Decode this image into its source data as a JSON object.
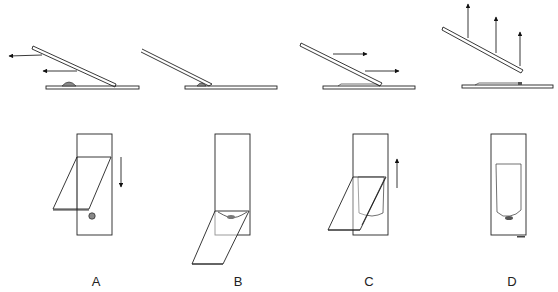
{
  "figure": {
    "panels": [
      {
        "id": "A",
        "label": "A",
        "stage": "spreader slide drawn back into drop",
        "side_arrows": "left",
        "top_arrow": "down"
      },
      {
        "id": "B",
        "label": "B",
        "stage": "drop spreads along edge of spreader",
        "side_arrows": "none",
        "top_arrow": "none"
      },
      {
        "id": "C",
        "label": "C",
        "stage": "spreader pushed forward forming film",
        "side_arrows": "right",
        "top_arrow": "up"
      },
      {
        "id": "D",
        "label": "D",
        "stage": "spreader lifted, finished smear",
        "side_arrows": "up",
        "top_arrow": "none"
      }
    ]
  },
  "labels": {
    "a": "A",
    "b": "B",
    "c": "C",
    "d": "D"
  },
  "colors": {
    "line": "#222222",
    "background": "#ffffff"
  }
}
